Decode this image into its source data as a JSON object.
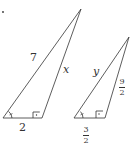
{
  "figure_marker": "•",
  "triangles": [
    {
      "id": "triangle-large",
      "vertices": {
        "bottom_left": [
          3,
          118
        ],
        "bottom_right": [
          42,
          118
        ],
        "apex": [
          81,
          9
        ]
      },
      "labels": {
        "left_side": "7",
        "right_side": "x",
        "base": "2"
      }
    },
    {
      "id": "triangle-small",
      "vertices": {
        "bottom_left": [
          74,
          118
        ],
        "bottom_right": [
          105,
          118
        ],
        "apex": [
          129,
          37
        ]
      },
      "labels": {
        "left_side": "y",
        "right_side": {
          "num": "9",
          "den": "2"
        },
        "base": {
          "num": "3",
          "den": "2"
        }
      }
    }
  ],
  "colors": {
    "stroke": "#333333",
    "background": "#ffffff"
  }
}
